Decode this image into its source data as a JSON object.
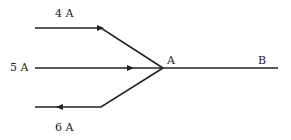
{
  "diagram": {
    "type": "circuit-junction",
    "labels": {
      "top_current": "4 A",
      "middle_current": "5 A",
      "bottom_current": "6 A",
      "junction": "A",
      "end_point": "B"
    },
    "wires": [
      {
        "name": "top-wire",
        "current": "4 A",
        "direction": "toward-junction"
      },
      {
        "name": "middle-wire",
        "current": "5 A",
        "direction": "toward-junction"
      },
      {
        "name": "bottom-wire",
        "current": "6 A",
        "direction": "away-from-junction"
      },
      {
        "name": "wire-ab",
        "from": "A",
        "to": "B"
      }
    ],
    "colors": {
      "line": "#222222",
      "background": "#ffffff"
    }
  }
}
